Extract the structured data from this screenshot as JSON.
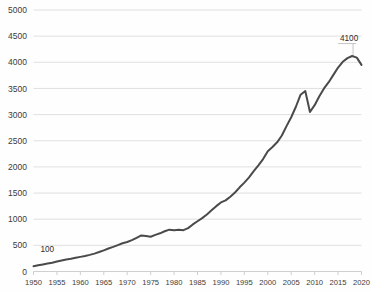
{
  "chart_data": {
    "type": "line",
    "title": "",
    "subtitle": "",
    "xlabel": "",
    "ylabel": "",
    "xlim": [
      1950,
      2020
    ],
    "ylim": [
      0,
      5000
    ],
    "grid": true,
    "legend": null,
    "legend_position": "none",
    "y_ticks": [
      0,
      500,
      1000,
      1500,
      2000,
      2500,
      3000,
      3500,
      4000,
      4500,
      5000
    ],
    "y_tick_labels": [
      "0",
      "500",
      "1000",
      "1500",
      "2000",
      "2500",
      "3000",
      "3500",
      "4000",
      "4500",
      "5000"
    ],
    "x_ticks": [
      1950,
      1955,
      1960,
      1965,
      1970,
      1975,
      1980,
      1985,
      1990,
      1995,
      2000,
      2005,
      2010,
      2015,
      2020
    ],
    "x_tick_labels": [
      "1950",
      "1955",
      "1960",
      "1965",
      "1970",
      "1975",
      "1980",
      "1985",
      "1990",
      "1995",
      "2000",
      "2005",
      "2010",
      "2015",
      "2020"
    ],
    "annotations": [
      {
        "name": "start-value",
        "text": "100",
        "x": 1951.5,
        "y": 100,
        "dy": -14
      },
      {
        "name": "peak-value",
        "text": "4100",
        "x": 2017.5,
        "y": 4100,
        "dy": -16
      }
    ],
    "series": [
      {
        "name": "index",
        "color": "#4a4a4a",
        "x": [
          1950,
          1951,
          1952,
          1953,
          1954,
          1955,
          1956,
          1957,
          1958,
          1959,
          1960,
          1961,
          1962,
          1963,
          1964,
          1965,
          1966,
          1967,
          1968,
          1969,
          1970,
          1971,
          1972,
          1973,
          1974,
          1975,
          1976,
          1977,
          1978,
          1979,
          1980,
          1981,
          1982,
          1983,
          1984,
          1985,
          1986,
          1987,
          1988,
          1989,
          1990,
          1991,
          1992,
          1993,
          1994,
          1995,
          1996,
          1997,
          1998,
          1999,
          2000,
          2001,
          2002,
          2003,
          2004,
          2005,
          2006,
          2007,
          2008,
          2009,
          2010,
          2011,
          2012,
          2013,
          2014,
          2015,
          2016,
          2017,
          2018,
          2019,
          2020
        ],
        "values": [
          100,
          118,
          135,
          152,
          168,
          190,
          210,
          228,
          242,
          262,
          280,
          296,
          318,
          342,
          372,
          405,
          440,
          470,
          505,
          540,
          565,
          600,
          645,
          690,
          680,
          665,
          700,
          730,
          770,
          800,
          790,
          800,
          790,
          830,
          900,
          960,
          1020,
          1090,
          1170,
          1250,
          1320,
          1360,
          1430,
          1510,
          1610,
          1700,
          1800,
          1920,
          2030,
          2150,
          2300,
          2380,
          2470,
          2600,
          2780,
          2950,
          3150,
          3380,
          3450,
          3050,
          3180,
          3350,
          3500,
          3620,
          3760,
          3900,
          4010,
          4080,
          4120,
          4090,
          3950
        ]
      }
    ]
  }
}
